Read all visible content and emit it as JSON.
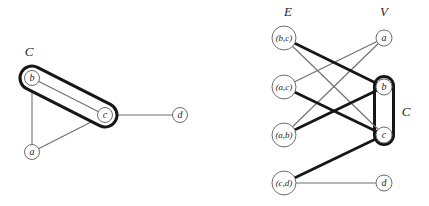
{
  "figure": {
    "width": 429,
    "height": 206,
    "background": "#ffffff"
  },
  "style": {
    "thin_color": "#6e6e6e",
    "thin_width": 1.1,
    "thick_color": "#161616",
    "thick_width": 2.7,
    "node_fill": "#ffffff",
    "node_stroke": "#6e6e6e",
    "node_stroke_width": 1,
    "capsule_color": "#161616",
    "capsule_fill": "#ffffff",
    "text_color": "#1f1f1f",
    "label_font_size": 13,
    "small_node_font_size": 10,
    "large_node_font_size": 9
  },
  "graphs": [
    {
      "name": "left-graph-with-cover",
      "labels": [
        {
          "text": "C",
          "x": 29,
          "y": 56
        }
      ],
      "capsule": {
        "x1": 32,
        "y1": 78,
        "x2": 105,
        "y2": 115,
        "outer_width": 27,
        "inner_width": 21
      },
      "nodes": [
        {
          "id": "b",
          "label": "b",
          "x": 32,
          "y": 78,
          "r": 7.5
        },
        {
          "id": "c",
          "label": "c",
          "x": 105,
          "y": 115,
          "r": 7.5
        },
        {
          "id": "a",
          "label": "a",
          "x": 32,
          "y": 152,
          "r": 7.5
        },
        {
          "id": "d",
          "label": "d",
          "x": 180,
          "y": 115,
          "r": 7.5
        }
      ],
      "edges": [
        {
          "from": "b",
          "to": "a",
          "thick": false,
          "above_capsule": false
        },
        {
          "from": "a",
          "to": "c",
          "thick": false,
          "above_capsule": false
        },
        {
          "from": "c",
          "to": "d",
          "thick": false,
          "above_capsule": false
        },
        {
          "from": "b",
          "to": "c",
          "thick": false,
          "above_capsule": true
        }
      ]
    },
    {
      "name": "right-bipartite-incidence",
      "labels": [
        {
          "text": "E",
          "x": 288,
          "y": 16
        },
        {
          "text": "V",
          "x": 384,
          "y": 16
        },
        {
          "text": "C",
          "x": 406,
          "y": 116
        }
      ],
      "capsule": {
        "x1": 384,
        "y1": 86,
        "x2": 384,
        "y2": 135,
        "outer_width": 22,
        "inner_width": 16
      },
      "nodes": [
        {
          "id": "bc",
          "label": "(b,c)",
          "x": 284,
          "y": 38,
          "r": 12
        },
        {
          "id": "ac",
          "label": "(a,c)",
          "x": 284,
          "y": 87,
          "r": 12
        },
        {
          "id": "ab",
          "label": "(a,b)",
          "x": 284,
          "y": 135,
          "r": 12
        },
        {
          "id": "cd",
          "label": "(c,d)",
          "x": 284,
          "y": 183,
          "r": 12
        },
        {
          "id": "a",
          "label": "a",
          "x": 384,
          "y": 38,
          "r": 8
        },
        {
          "id": "b",
          "label": "b",
          "x": 384,
          "y": 87,
          "r": 8
        },
        {
          "id": "c",
          "label": "c",
          "x": 384,
          "y": 135,
          "r": 8
        },
        {
          "id": "d",
          "label": "d",
          "x": 384,
          "y": 183,
          "r": 8
        }
      ],
      "edges": [
        {
          "from": "bc",
          "to": "c",
          "thick": false,
          "above_capsule": true
        },
        {
          "from": "ac",
          "to": "a",
          "thick": false,
          "above_capsule": true
        },
        {
          "from": "ab",
          "to": "a",
          "thick": false,
          "above_capsule": true
        },
        {
          "from": "cd",
          "to": "d",
          "thick": false,
          "above_capsule": true
        },
        {
          "from": "bc",
          "to": "b",
          "thick": true,
          "above_capsule": true
        },
        {
          "from": "ac",
          "to": "c",
          "thick": true,
          "above_capsule": true
        },
        {
          "from": "ab",
          "to": "b",
          "thick": true,
          "above_capsule": true
        },
        {
          "from": "cd",
          "to": "c",
          "thick": true,
          "above_capsule": true
        }
      ]
    }
  ]
}
